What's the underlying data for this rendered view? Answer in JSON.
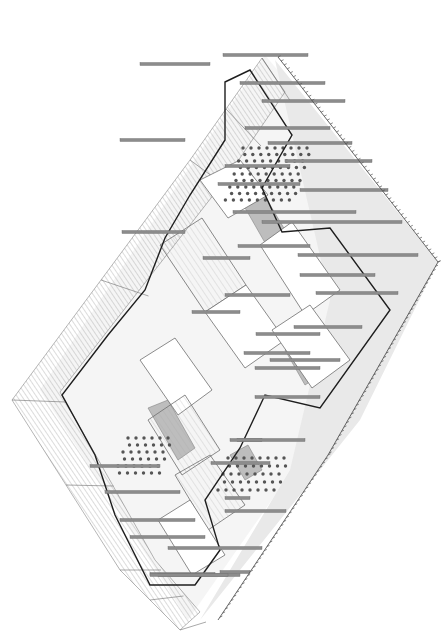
{
  "drawing": {
    "type": "axonometric-site-drawing",
    "caption": "",
    "colors": {
      "background": "#ffffff",
      "hatch": "#9a9a9a",
      "outline": "#6e6e6e",
      "heavy_outline": "#1e1e1e",
      "bar": "#8c8c8c",
      "bar_edge": "#6a6a6a",
      "dot": "#555555",
      "ground_fill": "#efefef",
      "shade_fill": "#b4b4b4"
    },
    "ground_plane": {
      "points": [
        [
          265,
          55
        ],
        [
          438,
          262
        ],
        [
          188,
          620
        ],
        [
          40,
          390
        ]
      ]
    },
    "hatched_band_left": {
      "outer": [
        [
          262,
          58
        ],
        [
          190,
          160
        ],
        [
          12,
          400
        ],
        [
          120,
          570
        ],
        [
          180,
          630
        ]
      ],
      "inner": [
        [
          285,
          92
        ],
        [
          225,
          180
        ],
        [
          60,
          392
        ],
        [
          155,
          560
        ],
        [
          200,
          612
        ]
      ]
    },
    "ground_shade_right": {
      "points": [
        [
          275,
          60
        ],
        [
          438,
          262
        ],
        [
          360,
          420
        ],
        [
          200,
          620
        ],
        [
          290,
          470
        ],
        [
          330,
          300
        ]
      ]
    },
    "heavy_outline": {
      "points": [
        [
          225,
          82
        ],
        [
          250,
          70
        ],
        [
          292,
          135
        ],
        [
          262,
          188
        ],
        [
          282,
          232
        ],
        [
          330,
          228
        ],
        [
          390,
          310
        ],
        [
          320,
          408
        ],
        [
          265,
          395
        ],
        [
          240,
          448
        ],
        [
          205,
          500
        ],
        [
          220,
          550
        ],
        [
          195,
          585
        ],
        [
          150,
          585
        ],
        [
          115,
          515
        ],
        [
          95,
          455
        ],
        [
          62,
          395
        ],
        [
          108,
          335
        ],
        [
          145,
          290
        ],
        [
          165,
          238
        ],
        [
          190,
          195
        ],
        [
          225,
          140
        ]
      ]
    },
    "blocks": [
      {
        "name": "block-north-a",
        "points": [
          [
            200,
            180
          ],
          [
            240,
            160
          ],
          [
            268,
            195
          ],
          [
            228,
            218
          ]
        ]
      },
      {
        "name": "block-central-a",
        "points": [
          [
            160,
            245
          ],
          [
            202,
            218
          ],
          [
            246,
            285
          ],
          [
            205,
            312
          ]
        ]
      },
      {
        "name": "block-central-b",
        "points": [
          [
            205,
            312
          ],
          [
            246,
            285
          ],
          [
            285,
            340
          ],
          [
            245,
            368
          ]
        ]
      },
      {
        "name": "block-central-c",
        "points": [
          [
            140,
            360
          ],
          [
            175,
            338
          ],
          [
            212,
            390
          ],
          [
            178,
            415
          ]
        ]
      },
      {
        "name": "block-south-a",
        "points": [
          [
            148,
            420
          ],
          [
            185,
            395
          ],
          [
            220,
            450
          ],
          [
            182,
            475
          ]
        ]
      },
      {
        "name": "block-east-a",
        "points": [
          [
            260,
            245
          ],
          [
            292,
            222
          ],
          [
            340,
            290
          ],
          [
            305,
            315
          ]
        ]
      },
      {
        "name": "block-east-b",
        "points": [
          [
            272,
            330
          ],
          [
            310,
            305
          ],
          [
            350,
            360
          ],
          [
            312,
            388
          ]
        ]
      },
      {
        "name": "block-south-b",
        "points": [
          [
            175,
            475
          ],
          [
            210,
            455
          ],
          [
            245,
            505
          ],
          [
            208,
            530
          ]
        ]
      },
      {
        "name": "block-south-c",
        "points": [
          [
            158,
            520
          ],
          [
            190,
            500
          ],
          [
            225,
            555
          ],
          [
            192,
            575
          ]
        ]
      }
    ],
    "shaded_planes": [
      {
        "points": [
          [
            228,
            178
          ],
          [
            248,
            168
          ],
          [
            288,
            235
          ],
          [
            268,
            248
          ]
        ]
      },
      {
        "name": "shade-mid",
        "points": [
          [
            285,
            350
          ],
          [
            300,
            338
          ],
          [
            325,
            372
          ],
          [
            305,
            385
          ]
        ]
      },
      {
        "points": [
          [
            148,
            408
          ],
          [
            168,
            400
          ],
          [
            195,
            448
          ],
          [
            178,
            460
          ]
        ]
      },
      {
        "points": [
          [
            230,
            455
          ],
          [
            248,
            445
          ],
          [
            262,
            470
          ],
          [
            245,
            480
          ]
        ]
      }
    ],
    "dot_fields": [
      {
        "name": "dots-northeast",
        "x0": 243,
        "y0": 148,
        "cols": 9,
        "rows": 9,
        "dx": 8,
        "dy": 6.5,
        "skew": -2.2
      },
      {
        "name": "dots-southwest",
        "x0": 128,
        "y0": 438,
        "cols": 6,
        "rows": 6,
        "dx": 8,
        "dy": 7,
        "skew": -2.5
      },
      {
        "name": "dots-south",
        "x0": 228,
        "y0": 458,
        "cols": 8,
        "rows": 5,
        "dx": 8,
        "dy": 8,
        "skew": -2.5
      }
    ],
    "bars": [
      {
        "x1": 223,
        "x2": 308,
        "y": 55
      },
      {
        "x1": 240,
        "x2": 325,
        "y": 83
      },
      {
        "x1": 262,
        "x2": 345,
        "y": 101
      },
      {
        "x1": 245,
        "x2": 330,
        "y": 128
      },
      {
        "x1": 268,
        "x2": 352,
        "y": 143
      },
      {
        "x1": 285,
        "x2": 372,
        "y": 161
      },
      {
        "x1": 225,
        "x2": 290,
        "y": 166
      },
      {
        "x1": 300,
        "x2": 388,
        "y": 190
      },
      {
        "x1": 218,
        "x2": 300,
        "y": 184
      },
      {
        "x1": 233,
        "x2": 356,
        "y": 212
      },
      {
        "x1": 262,
        "x2": 402,
        "y": 222
      },
      {
        "x1": 238,
        "x2": 310,
        "y": 246
      },
      {
        "x1": 298,
        "x2": 418,
        "y": 255
      },
      {
        "x1": 300,
        "x2": 375,
        "y": 275
      },
      {
        "x1": 316,
        "x2": 398,
        "y": 293
      },
      {
        "x1": 294,
        "x2": 362,
        "y": 327
      },
      {
        "x1": 256,
        "x2": 320,
        "y": 334
      },
      {
        "x1": 244,
        "x2": 310,
        "y": 353
      },
      {
        "x1": 270,
        "x2": 340,
        "y": 360
      },
      {
        "x1": 255,
        "x2": 320,
        "y": 368
      },
      {
        "x1": 255,
        "x2": 320,
        "y": 397
      },
      {
        "x1": 140,
        "x2": 210,
        "y": 64
      },
      {
        "x1": 120,
        "x2": 185,
        "y": 140
      },
      {
        "x1": 122,
        "x2": 185,
        "y": 232
      },
      {
        "x1": 203,
        "x2": 250,
        "y": 258
      },
      {
        "x1": 225,
        "x2": 290,
        "y": 295
      },
      {
        "x1": 192,
        "x2": 240,
        "y": 312
      },
      {
        "x1": 90,
        "x2": 160,
        "y": 466
      },
      {
        "x1": 105,
        "x2": 180,
        "y": 492
      },
      {
        "x1": 120,
        "x2": 195,
        "y": 520
      },
      {
        "x1": 130,
        "x2": 205,
        "y": 537
      },
      {
        "x1": 168,
        "x2": 262,
        "y": 548
      },
      {
        "x1": 150,
        "x2": 215,
        "y": 574
      },
      {
        "x1": 158,
        "x2": 240,
        "y": 575
      },
      {
        "x1": 150,
        "x2": 228,
        "y": 575
      },
      {
        "x1": 237,
        "x2": 262,
        "y": 440
      },
      {
        "x1": 225,
        "x2": 250,
        "y": 498
      },
      {
        "x1": 220,
        "x2": 250,
        "y": 572
      },
      {
        "x1": 230,
        "x2": 305,
        "y": 440
      },
      {
        "x1": 211,
        "x2": 270,
        "y": 463
      },
      {
        "x1": 225,
        "x2": 286,
        "y": 511
      }
    ],
    "tick_edges": [
      {
        "from": [
          278,
          57
        ],
        "to": [
          438,
          262
        ]
      },
      {
        "from": [
          438,
          262
        ],
        "to": [
          328,
          455
        ]
      },
      {
        "from": [
          328,
          455
        ],
        "to": [
          218,
          620
        ]
      }
    ]
  }
}
